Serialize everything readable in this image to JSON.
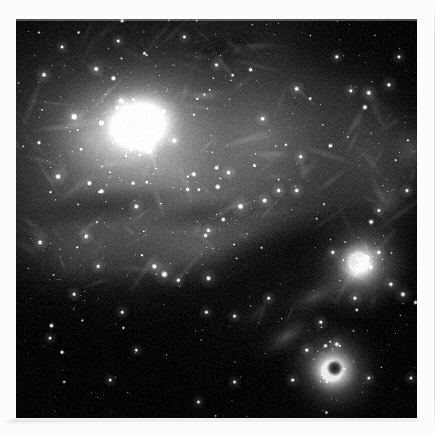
{
  "page": {
    "background_color": "#fcfcfb",
    "kind": "printed-plate-page"
  },
  "plate": {
    "name": "astronomical-photograph",
    "title": "",
    "caption": "",
    "medium": "grayscale photographic plate",
    "subject": "emission nebula complex with embedded star cluster and dark dust lanes",
    "orientation": "landscape-square",
    "frame": {
      "x": 16,
      "y": 19,
      "width": 401,
      "height": 399
    },
    "palette": {
      "sky_black": "#05060a",
      "faint_nebula": "#5a5e63",
      "mid_nebula": "#9a9ea2",
      "bright_nebula": "#d8dadc",
      "core_white": "#f4f5f5",
      "dark_lane": "#0b0d10",
      "star_white": "#ffffff"
    },
    "features": [
      {
        "name": "main-nebula-core",
        "label": "large bright nebulosity (upper left)",
        "cx": 0.3,
        "cy": 0.27,
        "r": 0.17,
        "brightness": 0.97
      },
      {
        "name": "secondary-nebula",
        "label": "bright nebula knot (right)",
        "cx": 0.86,
        "cy": 0.62,
        "r": 0.1,
        "brightness": 0.95
      },
      {
        "name": "lower-nebula",
        "label": "bright nebula with dark globule (lower right)",
        "cx": 0.79,
        "cy": 0.88,
        "r": 0.1,
        "brightness": 0.96
      },
      {
        "name": "dark-globule",
        "label": "dark globule in lower nebula",
        "cx": 0.795,
        "cy": 0.875,
        "r": 0.013,
        "brightness": 0.05
      },
      {
        "name": "central-star-group",
        "label": "bright star grouping (centre left)",
        "cx": 0.37,
        "cy": 0.66,
        "r": 0.05,
        "brightness": 1.0
      },
      {
        "name": "diagonal-dark-lane",
        "label": "diagonal dust lane across centre",
        "cx": 0.55,
        "cy": 0.62,
        "r": 0.3,
        "brightness": 0.1
      },
      {
        "name": "dark-lower-left-field",
        "label": "obscured dark field (lower left)",
        "cx": 0.18,
        "cy": 0.86,
        "r": 0.3,
        "brightness": 0.03
      },
      {
        "name": "dark-patch-upper",
        "label": "small dark nebula patch (upper centre)",
        "cx": 0.5,
        "cy": 0.08,
        "r": 0.05,
        "brightness": 0.18
      }
    ],
    "star_count_estimate": 2200
  }
}
